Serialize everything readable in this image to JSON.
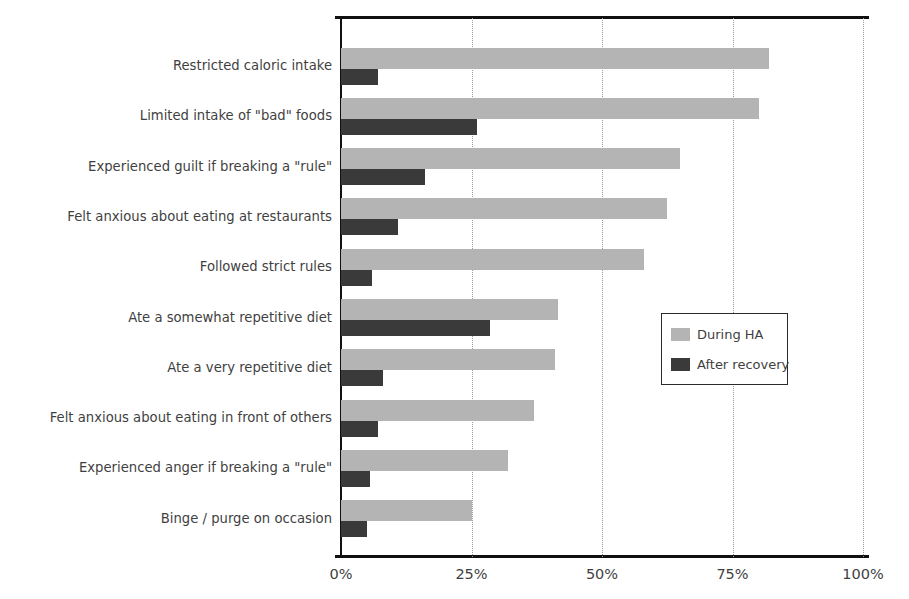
{
  "chart_data": {
    "type": "bar",
    "orientation": "horizontal",
    "title": "",
    "xlabel": "",
    "ylabel": "",
    "xlim": [
      0,
      100
    ],
    "xticks": [
      0,
      25,
      50,
      75,
      100
    ],
    "xtick_labels": [
      "0%",
      "25%",
      "50%",
      "75%",
      "100%"
    ],
    "grid": "vertical-dotted",
    "legend_position": "center-right",
    "categories": [
      "Restricted caloric intake",
      "Limited intake of \"bad\" foods",
      "Experienced guilt if breaking a \"rule\"",
      "Felt anxious about eating at restaurants",
      "Followed strict rules",
      "Ate a somewhat repetitive diet",
      "Ate a very repetitive diet",
      "Felt anxious about eating in front of others",
      "Experienced anger if breaking a \"rule\"",
      "Binge / purge on occasion"
    ],
    "series": [
      {
        "name": "During HA",
        "color": "#b4b4b4",
        "values": [
          82,
          80,
          65,
          62.5,
          58,
          41.5,
          41,
          37,
          32,
          25
        ]
      },
      {
        "name": "After recovery",
        "color": "#3a3a3a",
        "values": [
          7,
          26,
          16,
          11,
          6,
          28.5,
          8,
          7,
          5.5,
          5
        ]
      }
    ]
  },
  "legend": {
    "items": [
      {
        "label": "During HA",
        "color": "#b4b4b4"
      },
      {
        "label": "After recovery",
        "color": "#3a3a3a"
      }
    ]
  }
}
